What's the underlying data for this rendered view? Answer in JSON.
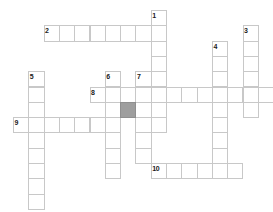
{
  "puzzle": {
    "title": "Crossword Grid",
    "cell_size": 15.3,
    "origin_x": 13,
    "origin_y": 10,
    "grid_cols": 17,
    "grid_rows": 13,
    "colors": {
      "cell_fill": "#ffffff",
      "cell_border": "#c8c8c8",
      "blocked_fill": "#9e9e9e",
      "number_color": "#1a1a1a",
      "page_background": "#ffffff"
    },
    "entries": [
      {
        "number": "1",
        "direction": "down",
        "col": 9,
        "row": 0,
        "length": 8
      },
      {
        "number": "2",
        "direction": "across",
        "col": 2,
        "row": 1,
        "length": 8
      },
      {
        "number": "3",
        "direction": "down",
        "col": 15,
        "row": 1,
        "length": 6
      },
      {
        "number": "4",
        "direction": "down",
        "col": 13,
        "row": 2,
        "length": 9
      },
      {
        "number": "5",
        "direction": "down",
        "col": 1,
        "row": 4,
        "length": 9
      },
      {
        "number": "6",
        "direction": "down",
        "col": 6,
        "row": 4,
        "length": 7
      },
      {
        "number": "7",
        "direction": "down",
        "col": 8,
        "row": 4,
        "length": 6
      },
      {
        "number": "8",
        "direction": "across",
        "col": 5,
        "row": 5,
        "length": 12
      },
      {
        "number": "9",
        "direction": "across",
        "col": 0,
        "row": 7,
        "length": 6
      },
      {
        "number": "10",
        "direction": "across",
        "col": 9,
        "row": 10,
        "length": 6
      }
    ],
    "blocked_cells": [
      {
        "col": 7,
        "row": 6
      }
    ],
    "numbered_cells": [
      {
        "number": "1",
        "col": 9,
        "row": 0
      },
      {
        "number": "2",
        "col": 2,
        "row": 1
      },
      {
        "number": "3",
        "col": 15,
        "row": 1
      },
      {
        "number": "4",
        "col": 13,
        "row": 2
      },
      {
        "number": "5",
        "col": 1,
        "row": 4
      },
      {
        "number": "6",
        "col": 6,
        "row": 4
      },
      {
        "number": "7",
        "col": 8,
        "row": 4
      },
      {
        "number": "8",
        "col": 5,
        "row": 5
      },
      {
        "number": "9",
        "col": 0,
        "row": 7
      },
      {
        "number": "10",
        "col": 9,
        "row": 10
      }
    ]
  }
}
